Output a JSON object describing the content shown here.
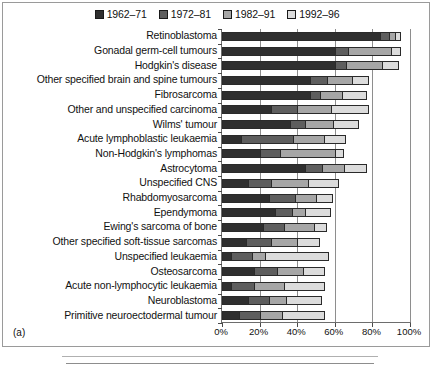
{
  "panel_tag": "(a)",
  "legend": {
    "entries": [
      {
        "label": "1962–71",
        "color": "#2f2f2f"
      },
      {
        "label": "1972–81",
        "color": "#5e5e5e"
      },
      {
        "label": "1982–91",
        "color": "#a6a6a6"
      },
      {
        "label": "1992–96",
        "color": "#dcdcdc"
      }
    ]
  },
  "axis": {
    "x_ticks": [
      "0%",
      "20%",
      "40%",
      "60%",
      "80%",
      "100%"
    ],
    "x_tick_values": [
      0,
      20,
      40,
      60,
      80,
      100
    ]
  },
  "chart_data": {
    "type": "bar",
    "orientation": "horizontal",
    "stacked": true,
    "title": "",
    "xlabel": "",
    "ylabel": "",
    "xlim": [
      0,
      100
    ],
    "grid": true,
    "legend_position": "top-center",
    "categories": [
      "Retinoblastoma",
      "Gonadal germ-cell tumours",
      "Hodgkin's disease",
      "Other specified brain and spine tumours",
      "Fibrosarcoma",
      "Other and unspecified carcinoma",
      "Wilms' tumour",
      "Acute lymphoblastic leukaemia",
      "Non-Hodgkin's lymphomas",
      "Astrocytoma",
      "Unspecified CNS",
      "Rhabdomyosarcoma",
      "Ependymoma",
      "Ewing's sarcoma of bone",
      "Other specified soft-tissue sarcomas",
      "Unspecified leukaemia",
      "Osteosarcoma",
      "Acute non-lymphocytic leukaemia",
      "Neuroblastoma",
      "Primitive neuroectodermal tumour"
    ],
    "series": [
      {
        "name": "1962–71",
        "color": "#2f2f2f",
        "values": [
          84,
          60,
          60,
          47,
          47,
          26,
          36,
          10,
          20,
          44,
          14,
          25,
          28,
          22,
          13,
          5,
          17,
          5,
          14,
          9
        ]
      },
      {
        "name": "1972–81",
        "color": "#5e5e5e",
        "values": [
          5,
          7,
          6,
          9,
          5,
          14,
          8,
          28,
          11,
          9,
          12,
          14,
          9,
          11,
          13,
          11,
          12,
          12,
          11,
          11
        ]
      },
      {
        "name": "1982–91",
        "color": "#a6a6a6",
        "values": [
          3,
          23,
          19,
          13,
          12,
          18,
          15,
          16,
          29,
          12,
          20,
          11,
          7,
          16,
          14,
          7,
          14,
          16,
          9,
          12
        ]
      },
      {
        "name": "1992–96",
        "color": "#dcdcdc",
        "values": [
          3,
          5,
          9,
          9,
          13,
          20,
          14,
          12,
          5,
          12,
          16,
          9,
          14,
          7,
          12,
          34,
          12,
          22,
          19,
          23
        ]
      }
    ],
    "totals": [
      95,
      95,
      94,
      78,
      77,
      78,
      73,
      66,
      65,
      77,
      62,
      59,
      58,
      56,
      52,
      57,
      55,
      55,
      53,
      55
    ]
  }
}
